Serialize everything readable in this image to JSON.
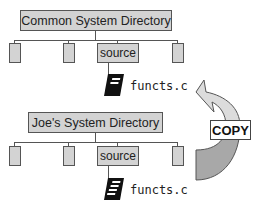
{
  "top_tree": {
    "title": "Common System Directory",
    "child_label": "source",
    "file": "functs.c"
  },
  "bottom_tree": {
    "title": "Joe's System Directory",
    "child_label": "source",
    "file": "functs.c"
  },
  "arrow": {
    "label": "COPY"
  },
  "colors": {
    "box_fill": "#d3d3d3",
    "arrow_light": "#d8d8d8",
    "arrow_dark": "#a8a8a8",
    "line": "#555555"
  }
}
